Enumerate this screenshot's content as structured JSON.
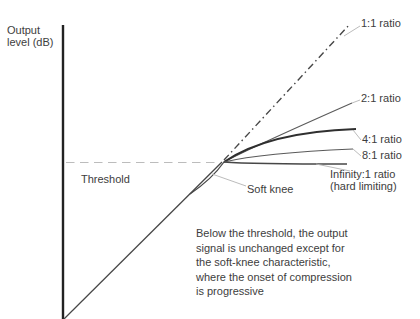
{
  "figure": {
    "axis": {
      "y_label": [
        "Output",
        "level (dB)"
      ]
    },
    "threshold": {
      "label": "Threshold"
    },
    "soft_knee": {
      "label": "Soft knee"
    },
    "ratios": {
      "one_to_one": "1:1 ratio",
      "two_to_one": "2:1 ratio",
      "four_to_one": "4:1 ratio",
      "eight_to_one": "8:1 ratio",
      "infinity": [
        "Infinity:1 ratio",
        "(hard limiting)"
      ]
    },
    "note": [
      "Below the threshold, the output",
      "signal is unchanged except for",
      "the soft-knee characteristic,",
      "where the onset of compression",
      "is progressive"
    ],
    "colors": {
      "axis": "#222222",
      "line": "#474747",
      "line-dark": "#2f2f2f",
      "line-mid": "#5a5a5a",
      "leader": "#b3b3b3",
      "dashed": "#bcbcbc",
      "text": "#3d3d3d",
      "background": "#ffffff"
    }
  }
}
